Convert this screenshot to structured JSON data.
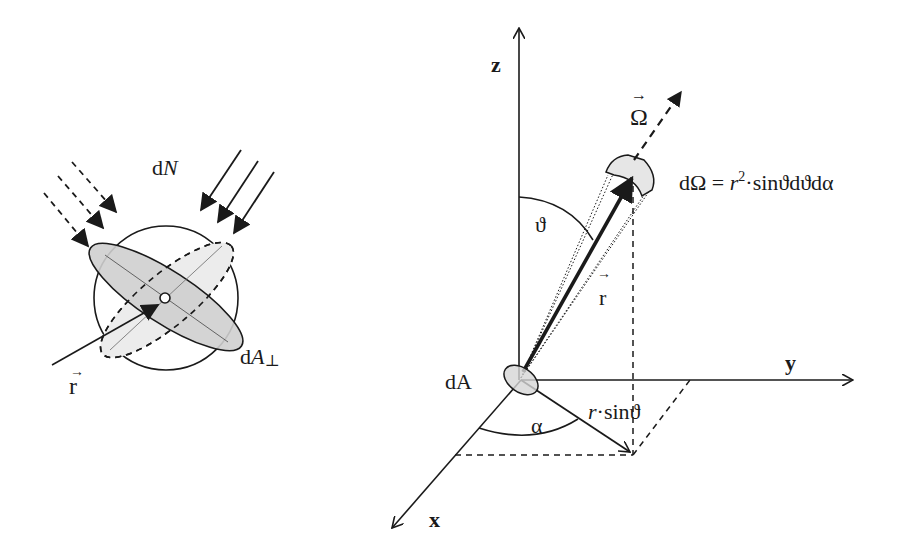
{
  "left_diagram": {
    "title": "Particle flux through cross-section",
    "labels": {
      "dN": {
        "d": "d",
        "var": "N"
      },
      "dA_perp": {
        "d": "d",
        "var": "A",
        "sub": "⊥"
      },
      "r_vec": {
        "arrow": "→",
        "var": "r"
      }
    },
    "incoming_rays": {
      "dashed_count": 3,
      "solid_count": 3
    }
  },
  "right_diagram": {
    "title": "Solid angle in spherical coordinates",
    "axes": {
      "z": "z",
      "y": "y",
      "x": "x"
    },
    "labels": {
      "omega_vec": {
        "arrow": "→",
        "var": "Ω"
      },
      "d_omega_formula": {
        "lhs": "dΩ = ",
        "r": "r",
        "sup": "2",
        "rest": "·sin϶dϑdα"
      },
      "theta": "ϑ",
      "r_vec": {
        "arrow": "→",
        "var": "r"
      },
      "dA": "dA",
      "alpha": "α",
      "r_sin_theta": {
        "r": "r",
        "rest": "·sinϑ"
      }
    }
  },
  "colors": {
    "ink": "#1a1a1a",
    "disk_fill": "#cfcfcf",
    "disk_fill_light": "#ececec",
    "background": "#ffffff"
  }
}
